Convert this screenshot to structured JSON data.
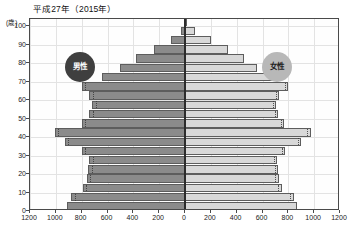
{
  "chart_data": {
    "type": "bar",
    "subtype": "population-pyramid",
    "title": "平成27年（2015年）",
    "xlabel": "",
    "ylabel": "(歳)",
    "grid": true,
    "legend_position": "inside-plot",
    "xlim": [
      -1200,
      1200
    ],
    "ylim": [
      0,
      104
    ],
    "x_tick_labels": [
      "1200",
      "1000",
      "800",
      "600",
      "400",
      "200",
      "0",
      "200",
      "400",
      "600",
      "800",
      "1000",
      "1200"
    ],
    "x_tick_values": [
      -1200,
      -1000,
      -800,
      -600,
      -400,
      -200,
      0,
      200,
      400,
      600,
      800,
      1000,
      1200
    ],
    "y_tick_labels": [
      "0",
      "10",
      "20",
      "30",
      "40",
      "50",
      "60",
      "70",
      "80",
      "90",
      "100"
    ],
    "y_tick_values": [
      0,
      10,
      20,
      30,
      40,
      50,
      60,
      70,
      80,
      90,
      100
    ],
    "series": [
      {
        "name": "男性",
        "side": "left",
        "color": "#8b8b8b",
        "categories": [
          "0-4",
          "5-9",
          "10-14",
          "15-19",
          "20-24",
          "25-29",
          "30-34",
          "35-39",
          "40-44",
          "45-49",
          "50-54",
          "55-59",
          "60-64",
          "65-69",
          "70-74",
          "75-79",
          "80-84",
          "85-89",
          "90-94",
          "95-99",
          "100+"
        ],
        "values": [
          910,
          880,
          790,
          760,
          750,
          740,
          800,
          930,
          1010,
          800,
          740,
          720,
          740,
          800,
          640,
          500,
          380,
          240,
          110,
          30,
          5
        ]
      },
      {
        "name": "女性",
        "side": "right",
        "color": "#d8d8d8",
        "categories": [
          "0-4",
          "5-9",
          "10-14",
          "15-19",
          "20-24",
          "25-29",
          "30-34",
          "35-39",
          "40-44",
          "45-49",
          "50-54",
          "55-59",
          "60-64",
          "65-69",
          "70-74",
          "75-79",
          "80-84",
          "85-89",
          "90-94",
          "95-99",
          "100+"
        ],
        "values": [
          865,
          840,
          750,
          725,
          720,
          715,
          775,
          900,
          975,
          770,
          720,
          705,
          730,
          800,
          680,
          560,
          460,
          330,
          200,
          75,
          15
        ]
      }
    ]
  },
  "labels": {
    "male_badge": "男性",
    "female_badge": "女性",
    "y_unit": "(歳)"
  }
}
